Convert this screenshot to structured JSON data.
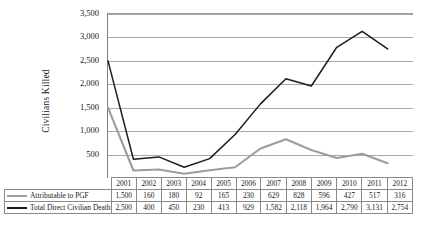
{
  "chart_data": {
    "type": "line",
    "title": "",
    "xlabel": "",
    "ylabel": "Civilians Killed",
    "categories": [
      "2001",
      "2002",
      "2003",
      "2004",
      "2005",
      "2006",
      "2007",
      "2008",
      "2009",
      "2010",
      "2011",
      "2012"
    ],
    "ylim": [
      0,
      3500
    ],
    "ytick_labels": [
      "3,500",
      "3,000",
      "2,500",
      "2,000",
      "1,500",
      "1,000",
      "500"
    ],
    "ytick_values": [
      3500,
      3000,
      2500,
      2000,
      1500,
      1000,
      500
    ],
    "grid": true,
    "legend_position": "table-left",
    "series": [
      {
        "name": "Attributable to PGF",
        "color": "#9d9d9d",
        "values": [
          1500,
          160,
          180,
          92,
          165,
          230,
          629,
          828,
          596,
          427,
          517,
          316
        ],
        "labels": [
          "1,500",
          "160",
          "180",
          "92",
          "165",
          "230",
          "629",
          "828",
          "596",
          "427",
          "517",
          "316"
        ]
      },
      {
        "name": "Total Direct Civilian Death",
        "color": "#1d1d1d",
        "values": [
          2500,
          400,
          450,
          230,
          413,
          929,
          1582,
          2118,
          1964,
          2790,
          3131,
          2754
        ],
        "labels": [
          "2,500",
          "400",
          "450",
          "230",
          "413",
          "929",
          "1,582",
          "2,118",
          "1,964",
          "2,790",
          "3,131",
          "2,754"
        ]
      }
    ]
  },
  "table": {
    "header_blank": "",
    "years": [
      "2001",
      "2002",
      "2003",
      "2004",
      "2005",
      "2006",
      "2007",
      "2008",
      "2009",
      "2010",
      "2011",
      "2012"
    ],
    "rows": [
      {
        "label": "Attributable to PGF",
        "swatch": "gray-line-icon",
        "values": [
          "1,500",
          "160",
          "180",
          "92",
          "165",
          "230",
          "629",
          "828",
          "596",
          "427",
          "517",
          "316"
        ]
      },
      {
        "label": "Total Direct Civilian Death",
        "swatch": "black-line-icon",
        "values": [
          "2,500",
          "400",
          "450",
          "230",
          "413",
          "929",
          "1,582",
          "2,118",
          "1,964",
          "2,790",
          "3,131",
          "2,754"
        ]
      }
    ]
  }
}
